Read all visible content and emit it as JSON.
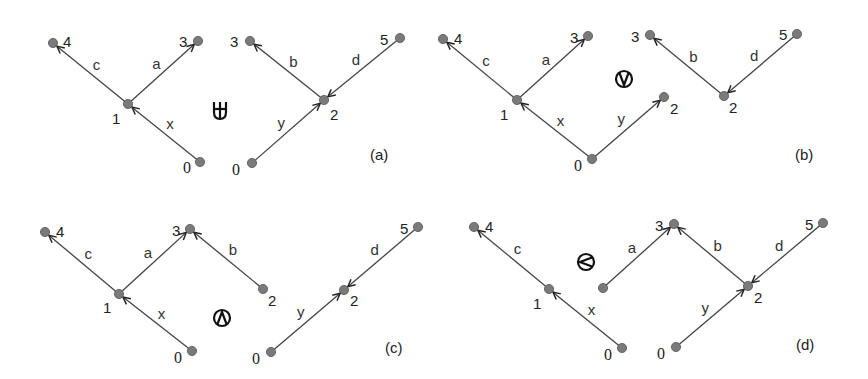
{
  "colors": {
    "node_fill": "#7a7a7a",
    "edge": "#444444",
    "text": "#222222"
  },
  "panels": [
    {
      "id": "a",
      "caption": "(a)",
      "operator": "multiset-union",
      "operator_icon": "u-plus-icon",
      "caption_pos": [
        370,
        160
      ],
      "operator_pos": [
        220,
        110
      ],
      "nodes": [
        {
          "key": "a1",
          "label": "4",
          "x": 53,
          "y": 43,
          "lx": 63,
          "ly": 47,
          "serif": false
        },
        {
          "key": "a2",
          "label": "3",
          "x": 198,
          "y": 41,
          "lx": 179,
          "ly": 47,
          "serif": false
        },
        {
          "key": "a3",
          "label": "1",
          "x": 128,
          "y": 104,
          "lx": 112,
          "ly": 124,
          "serif": false
        },
        {
          "key": "a4",
          "label": "0",
          "x": 200,
          "y": 162,
          "lx": 183,
          "ly": 173,
          "serif": true
        },
        {
          "key": "a5",
          "label": "3",
          "x": 250,
          "y": 41,
          "lx": 230,
          "ly": 47,
          "serif": false
        },
        {
          "key": "a6",
          "label": "5",
          "x": 400,
          "y": 38,
          "lx": 380,
          "ly": 45,
          "serif": false
        },
        {
          "key": "a7",
          "label": "2",
          "x": 324,
          "y": 100,
          "lx": 330,
          "ly": 120,
          "serif": false
        },
        {
          "key": "a8",
          "label": "0",
          "x": 252,
          "y": 163,
          "lx": 232,
          "ly": 175,
          "serif": true
        }
      ],
      "edges": [
        {
          "from": "a3",
          "to": "a1",
          "label": "c"
        },
        {
          "from": "a3",
          "to": "a2",
          "label": "a"
        },
        {
          "from": "a4",
          "to": "a3",
          "label": "x"
        },
        {
          "from": "a7",
          "to": "a5",
          "label": "b"
        },
        {
          "from": "a6",
          "to": "a7",
          "label": "d"
        },
        {
          "from": "a8",
          "to": "a7",
          "label": "y"
        }
      ]
    },
    {
      "id": "b",
      "caption": "(b)",
      "operator": "circled-or",
      "operator_icon": "circled-v-icon",
      "caption_pos": [
        795,
        160
      ],
      "operator_pos": [
        624,
        79
      ],
      "nodes": [
        {
          "key": "b1",
          "label": "4",
          "x": 443,
          "y": 39,
          "lx": 454,
          "ly": 44,
          "serif": false
        },
        {
          "key": "b2",
          "label": "3",
          "x": 588,
          "y": 36,
          "lx": 570,
          "ly": 43,
          "serif": false
        },
        {
          "key": "b3",
          "label": "1",
          "x": 517,
          "y": 100,
          "lx": 500,
          "ly": 120,
          "serif": false
        },
        {
          "key": "b4",
          "label": "0",
          "x": 592,
          "y": 159,
          "lx": 574,
          "ly": 171,
          "serif": true
        },
        {
          "key": "b5",
          "label": "2",
          "x": 664,
          "y": 97,
          "lx": 670,
          "ly": 114,
          "serif": false
        },
        {
          "key": "b6",
          "label": "3",
          "x": 650,
          "y": 35,
          "lx": 631,
          "ly": 42,
          "serif": false
        },
        {
          "key": "b7",
          "label": "5",
          "x": 797,
          "y": 34,
          "lx": 779,
          "ly": 40,
          "serif": false
        },
        {
          "key": "b8",
          "label": "2",
          "x": 724,
          "y": 96,
          "lx": 729,
          "ly": 113,
          "serif": false
        }
      ],
      "edges": [
        {
          "from": "b3",
          "to": "b1",
          "label": "c"
        },
        {
          "from": "b3",
          "to": "b2",
          "label": "a"
        },
        {
          "from": "b4",
          "to": "b3",
          "label": "x"
        },
        {
          "from": "b4",
          "to": "b5",
          "label": "y"
        },
        {
          "from": "b8",
          "to": "b6",
          "label": "b"
        },
        {
          "from": "b7",
          "to": "b8",
          "label": "d"
        }
      ]
    },
    {
      "id": "c",
      "caption": "(c)",
      "operator": "circled-and",
      "operator_icon": "circled-wedge-icon",
      "caption_pos": [
        385,
        353
      ],
      "operator_pos": [
        222,
        318
      ],
      "nodes": [
        {
          "key": "c1",
          "label": "4",
          "x": 45,
          "y": 232,
          "lx": 56,
          "ly": 237,
          "serif": false
        },
        {
          "key": "c2",
          "label": "3",
          "x": 190,
          "y": 229,
          "lx": 172,
          "ly": 236,
          "serif": false
        },
        {
          "key": "c3",
          "label": "1",
          "x": 119,
          "y": 294,
          "lx": 103,
          "ly": 313,
          "serif": false
        },
        {
          "key": "c4",
          "label": "0",
          "x": 192,
          "y": 351,
          "lx": 174,
          "ly": 363,
          "serif": true
        },
        {
          "key": "c5",
          "label": "2",
          "x": 263,
          "y": 289,
          "lx": 268,
          "ly": 306,
          "serif": false
        },
        {
          "key": "c6",
          "label": "0",
          "x": 271,
          "y": 352,
          "lx": 252,
          "ly": 364,
          "serif": true
        },
        {
          "key": "c7",
          "label": "2",
          "x": 344,
          "y": 290,
          "lx": 350,
          "ly": 306,
          "serif": false
        },
        {
          "key": "c8",
          "label": "5",
          "x": 418,
          "y": 227,
          "lx": 400,
          "ly": 234,
          "serif": false
        }
      ],
      "edges": [
        {
          "from": "c3",
          "to": "c1",
          "label": "c"
        },
        {
          "from": "c3",
          "to": "c2",
          "label": "a"
        },
        {
          "from": "c4",
          "to": "c3",
          "label": "x"
        },
        {
          "from": "c5",
          "to": "c2",
          "label": "b"
        },
        {
          "from": "c6",
          "to": "c7",
          "label": "y"
        },
        {
          "from": "c8",
          "to": "c7",
          "label": "d"
        }
      ]
    },
    {
      "id": "d",
      "caption": "(d)",
      "operator": "circled-less-than",
      "operator_icon": "circled-lt-icon",
      "caption_pos": [
        796,
        350
      ],
      "operator_pos": [
        586,
        262
      ],
      "nodes": [
        {
          "key": "d1",
          "label": "4",
          "x": 474,
          "y": 227,
          "lx": 485,
          "ly": 232,
          "serif": false
        },
        {
          "key": "d2",
          "label": "1",
          "x": 549,
          "y": 289,
          "lx": 533,
          "ly": 309,
          "serif": false
        },
        {
          "key": "d3",
          "label": "0",
          "x": 622,
          "y": 348,
          "lx": 604,
          "ly": 360,
          "serif": true
        },
        {
          "key": "d4",
          "label": "",
          "x": 603,
          "y": 288,
          "lx": 0,
          "ly": 0,
          "serif": false
        },
        {
          "key": "d5",
          "label": "3",
          "x": 674,
          "y": 224,
          "lx": 655,
          "ly": 231,
          "serif": false
        },
        {
          "key": "d6",
          "label": "2",
          "x": 748,
          "y": 286,
          "lx": 754,
          "ly": 303,
          "serif": false
        },
        {
          "key": "d7",
          "label": "5",
          "x": 823,
          "y": 223,
          "lx": 805,
          "ly": 230,
          "serif": false
        },
        {
          "key": "d8",
          "label": "0",
          "x": 676,
          "y": 347,
          "lx": 657,
          "ly": 359,
          "serif": true
        }
      ],
      "edges": [
        {
          "from": "d2",
          "to": "d1",
          "label": "c"
        },
        {
          "from": "d3",
          "to": "d2",
          "label": "x"
        },
        {
          "from": "d4",
          "to": "d5",
          "label": "a"
        },
        {
          "from": "d6",
          "to": "d5",
          "label": "b"
        },
        {
          "from": "d7",
          "to": "d6",
          "label": "d"
        },
        {
          "from": "d8",
          "to": "d6",
          "label": "y"
        }
      ]
    }
  ]
}
